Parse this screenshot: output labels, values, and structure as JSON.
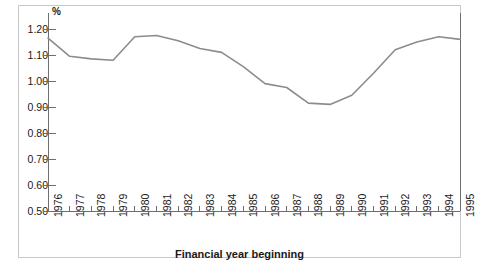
{
  "figure": {
    "border_color": "#c8c8c8",
    "background": "#ffffff"
  },
  "chart_data": {
    "type": "line",
    "title": "",
    "subtitle": "",
    "xlabel": "Financial year beginning",
    "ylabel": "%",
    "y_unit_label": "%",
    "categories": [
      "1976",
      "1977",
      "1978",
      "1979",
      "1980",
      "1981",
      "1982",
      "1983",
      "1984",
      "1985",
      "1986",
      "1987",
      "1988",
      "1989",
      "1990",
      "1991",
      "1992",
      "1993",
      "1994",
      "1995"
    ],
    "values": [
      1.165,
      1.095,
      1.085,
      1.08,
      1.17,
      1.175,
      1.155,
      1.125,
      1.11,
      1.055,
      0.99,
      0.975,
      0.915,
      0.91,
      0.945,
      1.03,
      1.12,
      1.15,
      1.17,
      1.16
    ],
    "ylim": [
      0.5,
      1.2
    ],
    "yticks": [
      0.5,
      0.6,
      0.7,
      0.8,
      0.9,
      1.0,
      1.1,
      1.2
    ],
    "ytick_labels": [
      "0.50",
      "0.60",
      "0.70",
      "0.80",
      "0.90",
      "1.00",
      "1.10",
      "1.20"
    ],
    "xlim": [
      "1976",
      "1995"
    ],
    "grid": false,
    "legend": null,
    "legend_position": "none",
    "series": [
      {
        "name": "",
        "color": "#8c8c8c",
        "line_width": 1.6,
        "values": [
          1.165,
          1.095,
          1.085,
          1.08,
          1.17,
          1.175,
          1.155,
          1.125,
          1.11,
          1.055,
          0.99,
          0.975,
          0.915,
          0.91,
          0.945,
          1.03,
          1.12,
          1.15,
          1.17,
          1.16
        ]
      }
    ],
    "axis_color": "#6e6e6e",
    "tick_color": "#6e6e6e",
    "right_spine": true,
    "top_spine": false
  }
}
